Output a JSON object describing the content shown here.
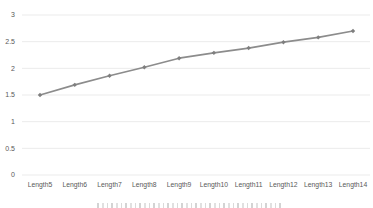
{
  "chart_data": {
    "type": "line",
    "title": "",
    "xlabel": "",
    "ylabel": "",
    "categories": [
      "Length5",
      "Length6",
      "Length7",
      "Length8",
      "Length9",
      "Length10",
      "Length11",
      "Length12",
      "Length13",
      "Length14"
    ],
    "series": [
      {
        "name": "",
        "values": [
          1.5,
          1.69,
          1.86,
          2.02,
          2.19,
          2.29,
          2.38,
          2.49,
          2.58,
          2.7
        ]
      }
    ],
    "ylim": [
      0,
      3
    ],
    "yticks": [
      {
        "label": "0",
        "value": 0
      },
      {
        "label": "0.5",
        "value": 0.5
      },
      {
        "label": "1",
        "value": 1
      },
      {
        "label": "1.5",
        "value": 1.5
      },
      {
        "label": "2",
        "value": 2
      },
      {
        "label": "2.5",
        "value": 2.5
      },
      {
        "label": "3",
        "value": 3
      }
    ],
    "grid": true,
    "legend": false,
    "marker": "diamond",
    "colors": {
      "background": "#ffffff",
      "gridline": "#ebebeb",
      "tick_label": "#595959",
      "line": "#8c8c8c",
      "marker": "#7f7f7f"
    }
  }
}
